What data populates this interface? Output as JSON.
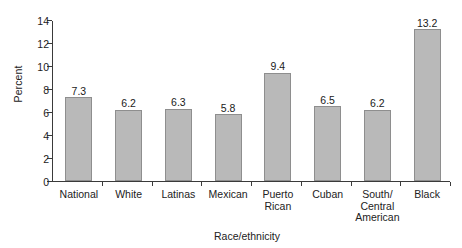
{
  "chart_data": {
    "type": "bar",
    "title": "",
    "xlabel": "Race/ethnicity",
    "ylabel": "Percent",
    "categories": [
      "National",
      "White",
      "Latinas",
      "Mexican",
      "Puerto Rican",
      "Cuban",
      "South/ Central American",
      "Black"
    ],
    "category_lines": [
      [
        "National"
      ],
      [
        "White"
      ],
      [
        "Latinas"
      ],
      [
        "Mexican"
      ],
      [
        "Puerto",
        "Rican"
      ],
      [
        "Cuban"
      ],
      [
        "South/",
        "Central",
        "American"
      ],
      [
        "Black"
      ]
    ],
    "values": [
      7.3,
      6.2,
      6.3,
      5.8,
      9.4,
      6.5,
      6.2,
      13.2
    ],
    "value_labels": [
      "7.3",
      "6.2",
      "6.3",
      "5.8",
      "9.4",
      "6.5",
      "6.2",
      "13.2"
    ],
    "ylim": [
      0,
      14
    ],
    "ytick_values": [
      0,
      2,
      4,
      6,
      8,
      10,
      12,
      14
    ],
    "ytick_labels": [
      "0",
      "2",
      "4",
      "6",
      "8",
      "10",
      "12",
      "14"
    ],
    "grid": false,
    "legend": false,
    "bar_color": "#b9b9b9",
    "bar_border_color": "#8e8e8e",
    "axis_color": "#3a3a3a",
    "background": "#ffffff"
  }
}
